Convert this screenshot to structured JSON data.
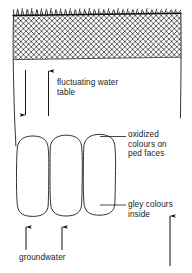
{
  "figure": {
    "type": "soil-profile-diagram",
    "title_visible": false,
    "colors": {
      "ink": "#1a1a1a",
      "background": "#ffffff",
      "hatch": "#2b2b2b",
      "vegetation": "#111111"
    }
  },
  "labels": {
    "water_table": "fluctuating water\ntable",
    "oxidized": "oxidized\ncolours on\nped faces",
    "gley": "gley colours\ninside",
    "groundwater": "groundwater"
  },
  "icons": {
    "arrow_down_water": "arrow-down-icon",
    "arrow_up_water": "arrow-up-icon",
    "arrow_up_groundwater_left": "arrow-up-icon",
    "arrow_up_groundwater_right": "arrow-up-icon",
    "arrow_up_gley": "arrow-up-icon"
  },
  "elements": {
    "vegetation_band": "grass-tuft-band",
    "hatched_horizon": "cross-hatched-horizon",
    "ped_count": 3,
    "leader_line_oxidized": "leader-line",
    "leader_line_gley": "leader-line"
  }
}
